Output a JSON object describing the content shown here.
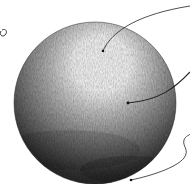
{
  "diagram": {
    "labels": [],
    "colors": {
      "background": "#ffffff",
      "highlight": "#ffffff",
      "midtone": "#8a8a8a",
      "shadow": "#1e1e1e",
      "line": "#222222"
    },
    "sphere": {
      "cx": 95,
      "cy": 103,
      "r": 81
    },
    "leaders": [
      {
        "name": "highlight-leader",
        "dot": [
          103,
          51
        ]
      },
      {
        "name": "midtone-leader",
        "dot": [
          128,
          103
        ]
      },
      {
        "name": "shadow-leader",
        "dot": [
          131,
          180
        ]
      }
    ]
  }
}
